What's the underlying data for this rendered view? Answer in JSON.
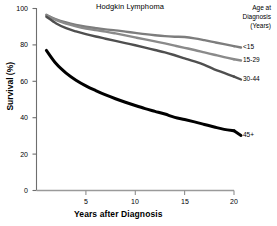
{
  "chart_data": {
    "type": "line",
    "title": "Hodgkin Lymphoma",
    "xlabel": "Years after Diagnosis",
    "ylabel": "Survival (%)",
    "xlim": [
      0,
      20
    ],
    "ylim": [
      0,
      100
    ],
    "xticks": [
      5,
      10,
      15,
      20
    ],
    "yticks": [
      0,
      20,
      40,
      60,
      80,
      100
    ],
    "grid": false,
    "legend_position": "right",
    "legend_title": "Age at Diagnosis (Years)",
    "legend_title_lines": [
      "Age at",
      "Diagnosis",
      "(Years)"
    ],
    "x": [
      1,
      2,
      3,
      4,
      5,
      6,
      7,
      8,
      9,
      10,
      11,
      12,
      13,
      14,
      15,
      16,
      17,
      18,
      19,
      20
    ],
    "series": [
      {
        "name": "<15",
        "color": "#7d7d7d",
        "values": [
          96.5,
          94.0,
          92.3,
          91.0,
          90.0,
          89.2,
          88.5,
          88.0,
          87.3,
          86.6,
          85.9,
          85.3,
          84.8,
          84.5,
          84.3,
          83.6,
          82.6,
          81.5,
          80.4,
          79.3
        ]
      },
      {
        "name": "15-29",
        "color": "#8a8a8a",
        "values": [
          96.3,
          93.6,
          91.7,
          90.2,
          89.0,
          88.1,
          87.3,
          86.3,
          85.2,
          84.1,
          83.0,
          81.9,
          80.8,
          79.6,
          78.4,
          77.2,
          75.9,
          74.6,
          73.3,
          72.1
        ]
      },
      {
        "name": "30-44",
        "color": "#4f4f4f",
        "values": [
          95.5,
          91.8,
          89.2,
          87.4,
          85.9,
          84.6,
          83.4,
          82.2,
          81.0,
          79.8,
          78.5,
          77.2,
          75.9,
          74.3,
          72.6,
          70.9,
          69.0,
          66.6,
          64.6,
          62.6
        ]
      },
      {
        "name": "45+",
        "color": "#000000",
        "values": [
          77.0,
          69.6,
          64.5,
          60.6,
          57.5,
          54.9,
          52.5,
          50.4,
          48.5,
          46.7,
          45.0,
          43.5,
          42.0,
          40.2,
          39.0,
          37.7,
          36.3,
          34.9,
          33.6,
          32.8
        ]
      }
    ]
  },
  "axis": {
    "yticklabels": [
      "100",
      "80",
      "60",
      "40",
      "20",
      "0"
    ],
    "xticklabels": [
      "5",
      "10",
      "15",
      "20"
    ]
  },
  "legend": {
    "line1": "Age at",
    "line2": "Diagnosis",
    "line3": "(Years)",
    "labels": [
      "<15",
      "15-29",
      "30-44",
      "45+"
    ]
  }
}
